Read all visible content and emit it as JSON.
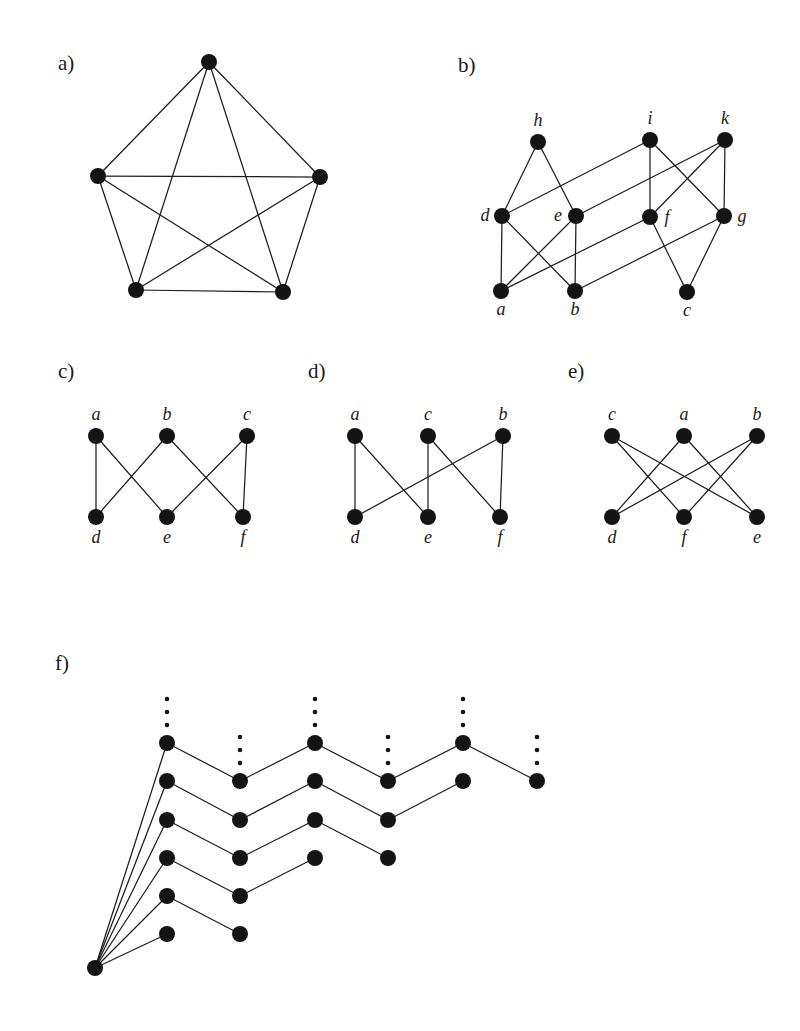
{
  "figure": {
    "background_color": "#ffffff",
    "ink_color": "#141414",
    "panels": [
      {
        "id": "a",
        "label": "a)",
        "label_pos": [
          58,
          70
        ],
        "description": "complete graph K5 drawn as pentagon with all diagonals",
        "vertex_radius": 8,
        "show_vertex_labels": false,
        "vertices": [
          {
            "name": "top",
            "x": 209,
            "y": 62,
            "label": ""
          },
          {
            "name": "left",
            "x": 98,
            "y": 176,
            "label": ""
          },
          {
            "name": "right",
            "x": 320,
            "y": 177,
            "label": ""
          },
          {
            "name": "bottom-left",
            "x": 136,
            "y": 290,
            "label": ""
          },
          {
            "name": "bottom-right",
            "x": 283,
            "y": 292,
            "label": ""
          }
        ],
        "edges": [
          [
            "top",
            "left"
          ],
          [
            "top",
            "right"
          ],
          [
            "top",
            "bottom-left"
          ],
          [
            "top",
            "bottom-right"
          ],
          [
            "left",
            "right"
          ],
          [
            "left",
            "bottom-left"
          ],
          [
            "left",
            "bottom-right"
          ],
          [
            "right",
            "bottom-left"
          ],
          [
            "right",
            "bottom-right"
          ],
          [
            "bottom-left",
            "bottom-right"
          ]
        ]
      },
      {
        "id": "b",
        "label": "b)",
        "label_pos": [
          458,
          72
        ],
        "description": "three-layer graph with vertices a b c, d e f g, h i k",
        "vertex_radius": 8,
        "show_vertex_labels": true,
        "vertices": [
          {
            "name": "h",
            "x": 538,
            "y": 142,
            "label": "h",
            "label_dx": 0,
            "label_dy": -16
          },
          {
            "name": "i",
            "x": 650,
            "y": 140,
            "label": "i",
            "label_dx": 0,
            "label_dy": -16
          },
          {
            "name": "k",
            "x": 725,
            "y": 140,
            "label": "k",
            "label_dx": 0,
            "label_dy": -16
          },
          {
            "name": "d",
            "x": 502,
            "y": 216,
            "label": "d",
            "label_dx": -17,
            "label_dy": 5
          },
          {
            "name": "e",
            "x": 576,
            "y": 216,
            "label": "e",
            "label_dx": -18,
            "label_dy": 5
          },
          {
            "name": "f",
            "x": 650,
            "y": 217,
            "label": "f",
            "label_dx": 17,
            "label_dy": 6
          },
          {
            "name": "g",
            "x": 724,
            "y": 216,
            "label": "g",
            "label_dx": 18,
            "label_dy": 6
          },
          {
            "name": "a",
            "x": 501,
            "y": 291,
            "label": "a",
            "label_dx": 0,
            "label_dy": 24
          },
          {
            "name": "b",
            "x": 575,
            "y": 291,
            "label": "b",
            "label_dx": 0,
            "label_dy": 24
          },
          {
            "name": "c",
            "x": 687,
            "y": 292,
            "label": "c",
            "label_dx": 0,
            "label_dy": 24
          }
        ],
        "edges": [
          [
            "h",
            "d"
          ],
          [
            "h",
            "e"
          ],
          [
            "i",
            "f"
          ],
          [
            "i",
            "g"
          ],
          [
            "k",
            "g"
          ],
          [
            "k",
            "f"
          ],
          [
            "d",
            "i"
          ],
          [
            "e",
            "k"
          ],
          [
            "d",
            "a"
          ],
          [
            "d",
            "b"
          ],
          [
            "e",
            "b"
          ],
          [
            "e",
            "a"
          ],
          [
            "a",
            "f"
          ],
          [
            "b",
            "g"
          ],
          [
            "f",
            "c"
          ],
          [
            "g",
            "c"
          ]
        ]
      },
      {
        "id": "c",
        "label": "c)",
        "label_pos": [
          58,
          378
        ],
        "description": "bipartite 3+3 graph, top a b c, bottom d e f",
        "vertex_radius": 8,
        "show_vertex_labels": true,
        "vertices": [
          {
            "name": "a",
            "x": 96,
            "y": 436,
            "label": "a",
            "label_dx": 0,
            "label_dy": -16
          },
          {
            "name": "b",
            "x": 167,
            "y": 436,
            "label": "b",
            "label_dx": 0,
            "label_dy": -16
          },
          {
            "name": "c",
            "x": 247,
            "y": 436,
            "label": "c",
            "label_dx": 0,
            "label_dy": -16
          },
          {
            "name": "d",
            "x": 96,
            "y": 517,
            "label": "d",
            "label_dx": 0,
            "label_dy": 26
          },
          {
            "name": "e",
            "x": 167,
            "y": 517,
            "label": "e",
            "label_dx": 0,
            "label_dy": 26
          },
          {
            "name": "f",
            "x": 243,
            "y": 517,
            "label": "f",
            "label_dx": 0,
            "label_dy": 26
          }
        ],
        "edges": [
          [
            "a",
            "d"
          ],
          [
            "a",
            "e"
          ],
          [
            "b",
            "d"
          ],
          [
            "b",
            "f"
          ],
          [
            "c",
            "e"
          ],
          [
            "c",
            "f"
          ]
        ]
      },
      {
        "id": "d",
        "label": "d)",
        "label_pos": [
          308,
          378
        ],
        "description": "bipartite 3+3 graph, top a c b, bottom d e f",
        "vertex_radius": 8,
        "show_vertex_labels": true,
        "vertices": [
          {
            "name": "a",
            "x": 355,
            "y": 436,
            "label": "a",
            "label_dx": 0,
            "label_dy": -16
          },
          {
            "name": "c",
            "x": 428,
            "y": 436,
            "label": "c",
            "label_dx": 0,
            "label_dy": -16
          },
          {
            "name": "b",
            "x": 503,
            "y": 436,
            "label": "b",
            "label_dx": 0,
            "label_dy": -16
          },
          {
            "name": "d",
            "x": 355,
            "y": 517,
            "label": "d",
            "label_dx": 0,
            "label_dy": 26
          },
          {
            "name": "e",
            "x": 428,
            "y": 517,
            "label": "e",
            "label_dx": 0,
            "label_dy": 26
          },
          {
            "name": "f",
            "x": 500,
            "y": 517,
            "label": "f",
            "label_dx": 0,
            "label_dy": 26
          }
        ],
        "edges": [
          [
            "a",
            "d"
          ],
          [
            "a",
            "e"
          ],
          [
            "c",
            "e"
          ],
          [
            "c",
            "f"
          ],
          [
            "b",
            "f"
          ],
          [
            "b",
            "d"
          ]
        ]
      },
      {
        "id": "e",
        "label": "e)",
        "label_pos": [
          568,
          378
        ],
        "description": "bipartite 3+3 graph with only crossing edges, top c a b, bottom d f e",
        "vertex_radius": 8,
        "show_vertex_labels": true,
        "vertices": [
          {
            "name": "c",
            "x": 612,
            "y": 436,
            "label": "c",
            "label_dx": 0,
            "label_dy": -16
          },
          {
            "name": "a",
            "x": 684,
            "y": 436,
            "label": "a",
            "label_dx": 0,
            "label_dy": -16
          },
          {
            "name": "b",
            "x": 757,
            "y": 436,
            "label": "b",
            "label_dx": 0,
            "label_dy": -16
          },
          {
            "name": "d",
            "x": 612,
            "y": 517,
            "label": "d",
            "label_dx": 0,
            "label_dy": 26
          },
          {
            "name": "f",
            "x": 684,
            "y": 517,
            "label": "f",
            "label_dx": 0,
            "label_dy": 26
          },
          {
            "name": "e",
            "x": 757,
            "y": 517,
            "label": "e",
            "label_dx": 0,
            "label_dy": 26
          }
        ],
        "edges": [
          [
            "c",
            "f"
          ],
          [
            "c",
            "e"
          ],
          [
            "a",
            "d"
          ],
          [
            "a",
            "e"
          ],
          [
            "b",
            "d"
          ],
          [
            "b",
            "f"
          ]
        ]
      },
      {
        "id": "f",
        "label": "f)",
        "label_pos": [
          55,
          670
        ],
        "description": "infinite zigzag tree: root at lower left joined to a column of six vertices, each starting a descending-then-ascending zigzag chain; vertical dots mark continuation",
        "vertex_radius": 8,
        "show_vertex_labels": false,
        "vertices": [
          {
            "name": "root",
            "x": 95,
            "y": 968,
            "label": ""
          },
          {
            "name": "c1r1",
            "x": 167,
            "y": 743,
            "label": ""
          },
          {
            "name": "c1r2",
            "x": 167,
            "y": 781,
            "label": ""
          },
          {
            "name": "c1r3",
            "x": 167,
            "y": 820,
            "label": ""
          },
          {
            "name": "c1r4",
            "x": 167,
            "y": 858,
            "label": ""
          },
          {
            "name": "c1r5",
            "x": 167,
            "y": 896,
            "label": ""
          },
          {
            "name": "c1r6",
            "x": 167,
            "y": 934,
            "label": ""
          },
          {
            "name": "c2r2",
            "x": 240,
            "y": 781,
            "label": ""
          },
          {
            "name": "c2r3",
            "x": 240,
            "y": 820,
            "label": ""
          },
          {
            "name": "c2r4",
            "x": 240,
            "y": 858,
            "label": ""
          },
          {
            "name": "c2r5",
            "x": 240,
            "y": 896,
            "label": ""
          },
          {
            "name": "c2r6",
            "x": 240,
            "y": 934,
            "label": ""
          },
          {
            "name": "c3r1",
            "x": 315,
            "y": 743,
            "label": ""
          },
          {
            "name": "c3r2",
            "x": 315,
            "y": 781,
            "label": ""
          },
          {
            "name": "c3r3",
            "x": 315,
            "y": 820,
            "label": ""
          },
          {
            "name": "c3r4",
            "x": 315,
            "y": 858,
            "label": ""
          },
          {
            "name": "c4r2",
            "x": 388,
            "y": 781,
            "label": ""
          },
          {
            "name": "c4r3",
            "x": 388,
            "y": 820,
            "label": ""
          },
          {
            "name": "c4r4",
            "x": 388,
            "y": 858,
            "label": ""
          },
          {
            "name": "c5r1",
            "x": 463,
            "y": 743,
            "label": ""
          },
          {
            "name": "c5r2",
            "x": 463,
            "y": 781,
            "label": ""
          },
          {
            "name": "c6r2",
            "x": 537,
            "y": 781,
            "label": ""
          }
        ],
        "edges": [
          [
            "root",
            "c1r1"
          ],
          [
            "root",
            "c1r2"
          ],
          [
            "root",
            "c1r3"
          ],
          [
            "root",
            "c1r4"
          ],
          [
            "root",
            "c1r5"
          ],
          [
            "root",
            "c1r6"
          ],
          [
            "c1r1",
            "c2r2"
          ],
          [
            "c2r2",
            "c3r1"
          ],
          [
            "c3r1",
            "c4r2"
          ],
          [
            "c4r2",
            "c5r1"
          ],
          [
            "c5r1",
            "c6r2"
          ],
          [
            "c1r2",
            "c2r3"
          ],
          [
            "c2r3",
            "c3r2"
          ],
          [
            "c3r2",
            "c4r3"
          ],
          [
            "c4r3",
            "c5r2"
          ],
          [
            "c1r3",
            "c2r4"
          ],
          [
            "c2r4",
            "c3r3"
          ],
          [
            "c3r3",
            "c4r4"
          ],
          [
            "c1r4",
            "c2r5"
          ],
          [
            "c2r5",
            "c3r4"
          ],
          [
            "c1r5",
            "c2r6"
          ]
        ],
        "continuation_dots": [
          {
            "name": "dots-above-c1r1",
            "x": 167,
            "y": 743,
            "count": 3,
            "spacing": 13,
            "offset": 18,
            "radius": 2.3
          },
          {
            "name": "dots-above-c2r2",
            "x": 240,
            "y": 781,
            "count": 3,
            "spacing": 13,
            "offset": 18,
            "radius": 2.3
          },
          {
            "name": "dots-above-c3r1",
            "x": 315,
            "y": 743,
            "count": 3,
            "spacing": 13,
            "offset": 18,
            "radius": 2.3
          },
          {
            "name": "dots-above-c4r2",
            "x": 388,
            "y": 781,
            "count": 3,
            "spacing": 13,
            "offset": 18,
            "radius": 2.3
          },
          {
            "name": "dots-above-c5r1",
            "x": 463,
            "y": 743,
            "count": 3,
            "spacing": 13,
            "offset": 18,
            "radius": 2.3
          },
          {
            "name": "dots-above-c6r2",
            "x": 537,
            "y": 781,
            "count": 3,
            "spacing": 13,
            "offset": 18,
            "radius": 2.3
          }
        ]
      }
    ]
  }
}
